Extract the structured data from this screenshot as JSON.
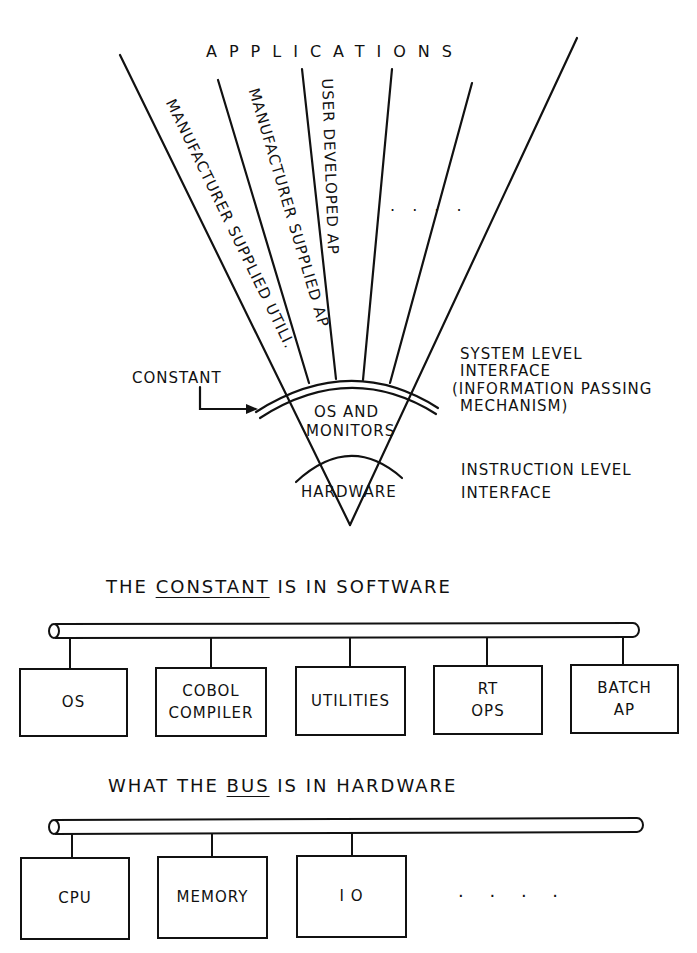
{
  "fan_diagram": {
    "top_label": "APPLICATIONS",
    "segments": [
      {
        "label": "MANUFACTURER SUPPLIED UTILI."
      },
      {
        "label": "MANUFACTURER SUPPLIED AP"
      },
      {
        "label": "USER DEVELOPED AP"
      },
      {
        "label": ". . . ."
      }
    ],
    "constant_label": "CONSTANT",
    "core_label_line1": "OS AND",
    "core_label_line2": "MONITORS",
    "hardware_label": "HARDWARE",
    "right_labels": {
      "system_level": [
        "SYSTEM LEVEL",
        "INTERFACE",
        "(INFORMATION PASSING",
        "MECHANISM)"
      ],
      "instruction_level": [
        "INSTRUCTION LEVEL",
        "INTERFACE"
      ]
    }
  },
  "software_section": {
    "caption_pre": "THE",
    "caption_underlined": "CONSTANT",
    "caption_post": "IS IN SOFTWARE",
    "boxes": [
      {
        "line1": "OS",
        "line2": ""
      },
      {
        "line1": "COBOL",
        "line2": "COMPILER"
      },
      {
        "line1": "UTILITIES",
        "line2": ""
      },
      {
        "line1": "RT",
        "line2": "OPS"
      },
      {
        "line1": "BATCH",
        "line2": "AP"
      }
    ]
  },
  "hardware_section": {
    "caption_pre": "WHAT THE",
    "caption_underlined": "BUS",
    "caption_post": "IS IN HARDWARE",
    "boxes": [
      {
        "line1": "CPU"
      },
      {
        "line1": "MEMORY"
      },
      {
        "line1": "I O"
      }
    ],
    "ellipsis": ". . . ."
  }
}
